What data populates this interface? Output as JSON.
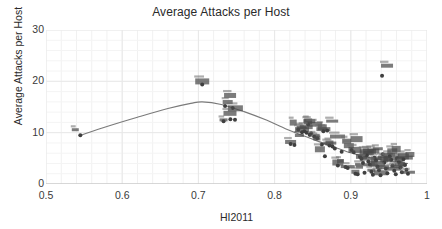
{
  "chart_data": {
    "type": "scatter",
    "title": "Average Attacks per Host",
    "xlabel": "HI2011",
    "ylabel": "Average Attacks per Host",
    "xlim": [
      0.5,
      1.0
    ],
    "ylim": [
      0,
      30
    ],
    "xticks": [
      "0.5",
      "0.6",
      "0.7",
      "0.8",
      "0.9",
      "1"
    ],
    "xtick_values": [
      0.5,
      0.6,
      0.7,
      0.8,
      0.9,
      1.0
    ],
    "yticks": [
      "0",
      "10",
      "20",
      "30"
    ],
    "ytick_values": [
      0,
      10,
      20,
      30
    ],
    "grid": true,
    "minor_grid": true,
    "legend": "none",
    "marker_color": "#3f3f3f",
    "fit_line_color": "#7a7a7a",
    "grid_color": "#e8e8e8",
    "axis_color": "#cfcfcf",
    "point_labels_rendered": "blurred",
    "points": [
      {
        "x": 0.545,
        "y": 9.5
      },
      {
        "x": 0.705,
        "y": 19.4
      },
      {
        "x": 0.735,
        "y": 15.2
      },
      {
        "x": 0.745,
        "y": 14.8
      },
      {
        "x": 0.733,
        "y": 12.2
      },
      {
        "x": 0.742,
        "y": 12.6
      },
      {
        "x": 0.748,
        "y": 12.5
      },
      {
        "x": 0.821,
        "y": 7.8
      },
      {
        "x": 0.826,
        "y": 7.6
      },
      {
        "x": 0.831,
        "y": 10.6
      },
      {
        "x": 0.836,
        "y": 10.1
      },
      {
        "x": 0.839,
        "y": 10.3
      },
      {
        "x": 0.842,
        "y": 10.0
      },
      {
        "x": 0.844,
        "y": 11.6
      },
      {
        "x": 0.846,
        "y": 9.6
      },
      {
        "x": 0.848,
        "y": 9.9
      },
      {
        "x": 0.852,
        "y": 9.2
      },
      {
        "x": 0.856,
        "y": 8.9
      },
      {
        "x": 0.862,
        "y": 7.7
      },
      {
        "x": 0.864,
        "y": 10.3
      },
      {
        "x": 0.869,
        "y": 10.4
      },
      {
        "x": 0.866,
        "y": 5.4
      },
      {
        "x": 0.872,
        "y": 7.5
      },
      {
        "x": 0.876,
        "y": 7.3
      },
      {
        "x": 0.879,
        "y": 6.9
      },
      {
        "x": 0.883,
        "y": 3.6
      },
      {
        "x": 0.888,
        "y": 6.3
      },
      {
        "x": 0.893,
        "y": 3.3
      },
      {
        "x": 0.896,
        "y": 3.1
      },
      {
        "x": 0.901,
        "y": 6.6
      },
      {
        "x": 0.904,
        "y": 6.2
      },
      {
        "x": 0.906,
        "y": 2.0
      },
      {
        "x": 0.909,
        "y": 1.9
      },
      {
        "x": 0.912,
        "y": 5.3
      },
      {
        "x": 0.914,
        "y": 4.9
      },
      {
        "x": 0.916,
        "y": 4.1
      },
      {
        "x": 0.918,
        "y": 2.2
      },
      {
        "x": 0.921,
        "y": 5.6
      },
      {
        "x": 0.923,
        "y": 4.4
      },
      {
        "x": 0.925,
        "y": 3.8
      },
      {
        "x": 0.927,
        "y": 2.4
      },
      {
        "x": 0.929,
        "y": 1.8
      },
      {
        "x": 0.931,
        "y": 5.1
      },
      {
        "x": 0.933,
        "y": 4.6
      },
      {
        "x": 0.935,
        "y": 3.4
      },
      {
        "x": 0.937,
        "y": 2.7
      },
      {
        "x": 0.939,
        "y": 1.7
      },
      {
        "x": 0.941,
        "y": 21.1
      },
      {
        "x": 0.942,
        "y": 5.8
      },
      {
        "x": 0.944,
        "y": 4.2
      },
      {
        "x": 0.946,
        "y": 3.0
      },
      {
        "x": 0.948,
        "y": 2.1
      },
      {
        "x": 0.951,
        "y": 5.4
      },
      {
        "x": 0.953,
        "y": 4.7
      },
      {
        "x": 0.955,
        "y": 3.6
      },
      {
        "x": 0.957,
        "y": 2.6
      },
      {
        "x": 0.959,
        "y": 1.9
      },
      {
        "x": 0.961,
        "y": 5.0
      },
      {
        "x": 0.963,
        "y": 4.3
      },
      {
        "x": 0.965,
        "y": 3.2
      },
      {
        "x": 0.967,
        "y": 2.3
      },
      {
        "x": 0.969,
        "y": 4.8
      },
      {
        "x": 0.971,
        "y": 3.7
      },
      {
        "x": 0.973,
        "y": 2.8
      },
      {
        "x": 0.975,
        "y": 2.0
      }
    ],
    "fit_curve": [
      {
        "x": 0.545,
        "y": 9.5
      },
      {
        "x": 0.58,
        "y": 11.2
      },
      {
        "x": 0.62,
        "y": 13.0
      },
      {
        "x": 0.66,
        "y": 14.7
      },
      {
        "x": 0.69,
        "y": 15.7
      },
      {
        "x": 0.705,
        "y": 16.0
      },
      {
        "x": 0.73,
        "y": 15.5
      },
      {
        "x": 0.76,
        "y": 14.1
      },
      {
        "x": 0.79,
        "y": 12.4
      },
      {
        "x": 0.82,
        "y": 10.4
      },
      {
        "x": 0.845,
        "y": 9.0
      },
      {
        "x": 0.87,
        "y": 7.6
      },
      {
        "x": 0.895,
        "y": 6.3
      },
      {
        "x": 0.92,
        "y": 5.3
      },
      {
        "x": 0.945,
        "y": 4.6
      },
      {
        "x": 0.975,
        "y": 4.0
      }
    ]
  }
}
